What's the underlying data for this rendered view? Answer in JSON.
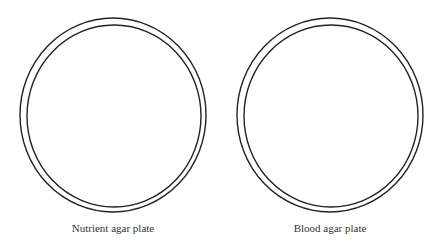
{
  "plates": [
    {
      "label": "Nutrient agar plate",
      "cx": 113,
      "cy": 115,
      "outer_rx": 93,
      "outer_ry": 97,
      "inner_rx": 87,
      "inner_ry": 91
    },
    {
      "label": "Blood agar plate",
      "cx": 330,
      "cy": 115,
      "outer_rx": 93,
      "outer_ry": 97,
      "inner_rx": 87,
      "inner_ry": 91
    }
  ],
  "colors": {
    "stroke": "#222222",
    "background": "#ffffff"
  }
}
